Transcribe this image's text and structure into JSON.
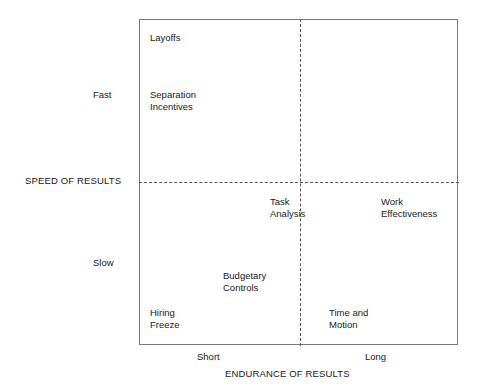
{
  "chart_data": {
    "type": "scatter",
    "title": "",
    "xlabel": "ENDURANCE OF RESULTS",
    "ylabel": "SPEED OF RESULTS",
    "x_ticks": [
      "Short",
      "Long"
    ],
    "y_ticks": [
      "Fast",
      "Slow"
    ],
    "grid": false,
    "legend": "none",
    "quadrant_divider_x": "middle",
    "quadrant_divider_y": "middle",
    "items": [
      {
        "label": "Layoffs",
        "quadrant": "fast-short",
        "x": "short",
        "y": "fast"
      },
      {
        "label": "Separation\nIncentives",
        "quadrant": "fast-short",
        "x": "short",
        "y": "fast"
      },
      {
        "label": "Task\nAnalysis",
        "quadrant": "slow-short",
        "x": "mid-short",
        "y": "near-mid-slow"
      },
      {
        "label": "Work\nEffectiveness",
        "quadrant": "slow-long",
        "x": "long",
        "y": "near-mid-slow"
      },
      {
        "label": "Budgetary\nControls",
        "quadrant": "slow-short",
        "x": "short",
        "y": "slow"
      },
      {
        "label": "Hiring\nFreeze",
        "quadrant": "slow-short",
        "x": "short",
        "y": "slow"
      },
      {
        "label": "Time and\nMotion",
        "quadrant": "slow-long",
        "x": "long",
        "y": "slow"
      }
    ]
  },
  "axes": {
    "y_title": "SPEED OF RESULTS",
    "x_title": "ENDURANCE OF RESULTS",
    "y_tick_high": "Fast",
    "y_tick_low": "Slow",
    "x_tick_low": "Short",
    "x_tick_high": "Long"
  },
  "quadrants": {
    "top_left": {
      "item_1": "Layoffs",
      "item_2": "Separation\nIncentives"
    },
    "bottom_left": {
      "item_1": "Budgetary\nControls",
      "item_2": "Hiring\nFreeze",
      "item_3": "Task\nAnalysis"
    },
    "bottom_right": {
      "item_1": "Work\nEffectiveness",
      "item_2": "Time and\nMotion"
    },
    "top_right": {}
  },
  "colors": {
    "frame_border": "#7a7a7a",
    "divider": "#555555",
    "text": "#1a1a1a",
    "background": "#ffffff"
  }
}
